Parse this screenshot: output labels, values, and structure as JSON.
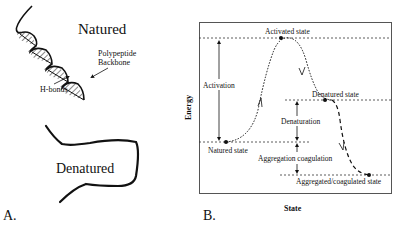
{
  "panel_a": {
    "label": "A.",
    "natured_title": "Natured",
    "polypeptide_label_line1": "Polypeptide",
    "polypeptide_label_line2": "Backbone",
    "hbonds_label": "H-bonds",
    "denatured_title": "Denatured"
  },
  "panel_b": {
    "label": "B.",
    "y_axis_label": "Energy",
    "x_axis_label": "State",
    "activated_state": "Activated state",
    "activation": "Activation",
    "denatured_state": "Denatured state",
    "denaturation": "Denaturation",
    "natured_state": "Natured state",
    "aggregation_coagulation": "Aggregation coagulation",
    "aggregated_state": "Aggregated/coagulated state"
  },
  "colors": {
    "ink": "#111111",
    "box": "#555555",
    "background": "#ffffff"
  }
}
